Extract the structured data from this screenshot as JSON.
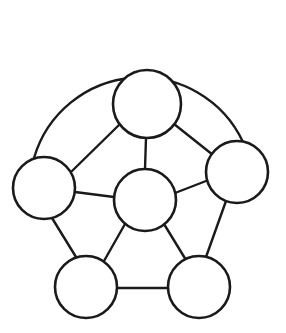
{
  "diagram": {
    "type": "node-link-graph",
    "background_color": "#ffffff",
    "stroke_color": "#1a1a1a",
    "node_fill_color": "#ffffff",
    "edge_stroke_width": 2.4,
    "node_stroke_width": 2.6,
    "canvas": {
      "width": 286,
      "height": 333
    },
    "nodes": [
      {
        "id": "top",
        "label": "",
        "cx": 147,
        "cy": 104,
        "r": 34
      },
      {
        "id": "left",
        "label": "",
        "cx": 44,
        "cy": 188,
        "r": 31
      },
      {
        "id": "right",
        "label": "",
        "cx": 237,
        "cy": 172,
        "r": 31
      },
      {
        "id": "center",
        "label": "",
        "cx": 145,
        "cy": 200,
        "r": 31
      },
      {
        "id": "bottom-left",
        "label": "",
        "cx": 86,
        "cy": 287,
        "r": 31
      },
      {
        "id": "bottom-right",
        "label": "",
        "cx": 199,
        "cy": 287,
        "r": 31
      }
    ],
    "edges": [
      {
        "id": "edge-left-top",
        "from": "left",
        "to": "top",
        "x1": 71,
        "y1": 172,
        "x2": 120,
        "y2": 124
      },
      {
        "id": "edge-top-right",
        "from": "top",
        "to": "right",
        "x1": 174,
        "y1": 124,
        "x2": 213,
        "y2": 155
      },
      {
        "id": "edge-top-center",
        "from": "top",
        "to": "center",
        "x1": 146,
        "y1": 138,
        "x2": 145,
        "y2": 169
      },
      {
        "id": "edge-left-center",
        "from": "left",
        "to": "center",
        "x1": 75,
        "y1": 192,
        "x2": 114,
        "y2": 197
      },
      {
        "id": "edge-right-center",
        "from": "right",
        "to": "center",
        "x1": 206,
        "y1": 181,
        "x2": 175,
        "y2": 193
      },
      {
        "id": "edge-left-bottomleft",
        "from": "left",
        "to": "bottom-left",
        "x1": 52,
        "y1": 218,
        "x2": 76,
        "y2": 257
      },
      {
        "id": "edge-right-bottomright",
        "from": "right",
        "to": "bottom-right",
        "x1": 226,
        "y1": 201,
        "x2": 206,
        "y2": 257
      },
      {
        "id": "edge-center-bottomleft",
        "from": "center",
        "to": "bottom-left",
        "x1": 125,
        "y1": 224,
        "x2": 104,
        "y2": 261
      },
      {
        "id": "edge-center-bottomright",
        "from": "center",
        "to": "bottom-right",
        "x1": 164,
        "y1": 224,
        "x2": 186,
        "y2": 260
      },
      {
        "id": "edge-bottomleft-bottomright",
        "from": "bottom-left",
        "to": "bottom-right",
        "x1": 117,
        "y1": 288,
        "x2": 168,
        "y2": 288
      }
    ],
    "arc": {
      "id": "outer-arc",
      "from": "left",
      "to": "right",
      "description": "large arc spanning over the top node from left node to right node",
      "path": "M 34,158 A 112 112 0 0 1 243,142"
    }
  }
}
